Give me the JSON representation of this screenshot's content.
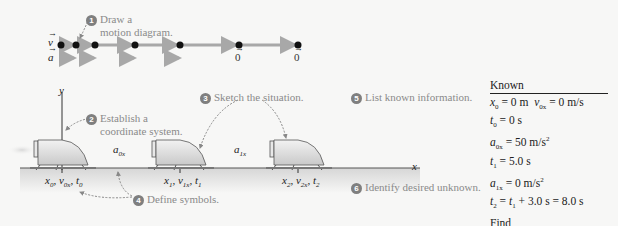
{
  "steps": [
    {
      "n": "1",
      "text_line1": "Draw a",
      "text_line2": "motion diagram."
    },
    {
      "n": "2",
      "text_line1": "Establish a",
      "text_line2": "coordinate system."
    },
    {
      "n": "3",
      "text": "Sketch the situation."
    },
    {
      "n": "4",
      "text": "Define symbols."
    },
    {
      "n": "5",
      "text": "List known information."
    },
    {
      "n": "6",
      "text": "Identify desired unknown."
    }
  ],
  "motion_diagram": {
    "v_label": "v",
    "a_label": "a",
    "zero_labels": [
      "0",
      "0"
    ]
  },
  "axes": {
    "y_label": "y",
    "x_label": "x"
  },
  "symbols": {
    "pos0": "x0, v0x, t0",
    "pos1": "x1, v1x, t1",
    "pos2": "x2, v2x, t2",
    "a0": "a0x",
    "a1": "a1x"
  },
  "known": {
    "header": "Known",
    "lines": [
      "x0 = 0 m  v0x = 0 m/s",
      "t0 = 0 s",
      "a0x = 50 m/s²",
      "t1 = 5.0 s",
      "a1x = 0 m/s²",
      "t2 = t1 + 3.0 s = 8.0 s"
    ]
  },
  "find": {
    "header": "Find",
    "value": "x2"
  },
  "colors": {
    "background": "#f7f7f6",
    "arrow_gray": "#a8a8a8",
    "dot": "#111111",
    "label_gray": "#8a8a8a"
  }
}
